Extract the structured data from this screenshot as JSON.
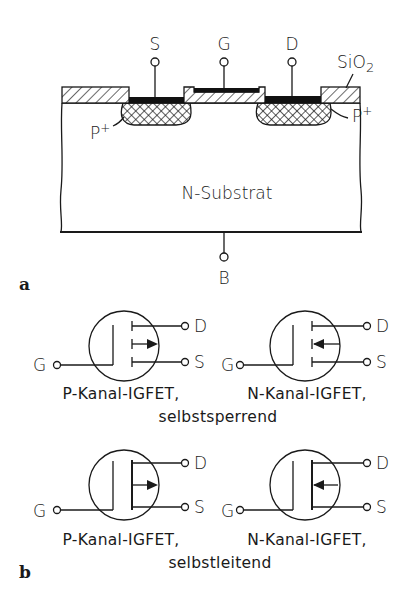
{
  "figure": {
    "part_a": {
      "label": "a",
      "terminals": {
        "source": "S",
        "gate": "G",
        "drain": "D",
        "bulk": "B"
      },
      "oxide_label": "SiO",
      "oxide_subscript": "2",
      "left_region_label": "P",
      "right_region_label": "P",
      "region_superscript": "+",
      "substrate_label": "N-Substrat"
    },
    "part_b": {
      "label": "b",
      "symbols": [
        {
          "id": "p-enh",
          "drain": "D",
          "source": "S",
          "gate": "G",
          "caption_line1": "P-Kanal-IGFET,",
          "arrow": "out"
        },
        {
          "id": "n-enh",
          "drain": "D",
          "source": "S",
          "gate": "G",
          "caption_line1": "N-Kanal-IGFET,",
          "arrow": "in"
        },
        {
          "id": "p-dep",
          "drain": "D",
          "source": "S",
          "gate": "G",
          "caption_line1": "P-Kanal-IGFET,",
          "arrow": "out"
        },
        {
          "id": "n-dep",
          "drain": "D",
          "source": "S",
          "gate": "G",
          "caption_line1": "N-Kanal-IGFET,",
          "arrow": "in"
        }
      ],
      "row1_caption_line2": "selbstsperrend",
      "row2_caption_line2": "selbstleitend"
    }
  }
}
